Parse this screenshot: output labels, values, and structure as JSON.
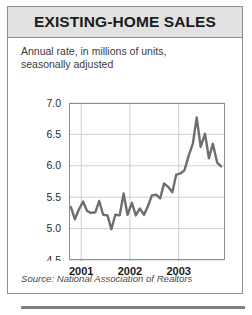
{
  "figure": {
    "title": "EXISTING-HOME SALES",
    "subtitle_lines": [
      "Annual rate, in millions of units,",
      "seasonally adjusted"
    ],
    "source": "Source: National Association of Realtors",
    "colors": {
      "title_band": "#e2e2e2",
      "border": "#8e8e8e",
      "line": "#6e6e6e",
      "grid": "#cfcfcf",
      "text": "#1b1b1b",
      "bottom_rule": "#808080"
    }
  },
  "chart_data": {
    "type": "line",
    "title": "EXISTING-HOME SALES",
    "subtitle": "Annual rate, in millions of units, seasonally adjusted",
    "source": "Source: National Association of Realtors",
    "xlabel": "",
    "ylabel": "",
    "ylim": [
      4.5,
      7.0
    ],
    "yticks": [
      7.0,
      6.5,
      6.0,
      5.5,
      5.0,
      4.5
    ],
    "ytick_labels": [
      "7.0",
      "6.5",
      "6.0",
      "5.5",
      "5.0",
      "4.5"
    ],
    "xticks": [
      2001,
      2002,
      2003
    ],
    "xtick_labels": [
      "2001",
      "2002",
      "2003"
    ],
    "xlim": [
      2000.75,
      2003.95
    ],
    "grid": true,
    "grid_axis": "both",
    "legend": false,
    "series": [
      {
        "name": "Existing-home sales",
        "units": "millions of units, annual rate",
        "x": [
          2000.79,
          2000.87,
          2000.95,
          2001.04,
          2001.12,
          2001.2,
          2001.29,
          2001.37,
          2001.45,
          2001.54,
          2001.62,
          2001.7,
          2001.79,
          2001.87,
          2001.95,
          2002.04,
          2002.12,
          2002.2,
          2002.29,
          2002.37,
          2002.45,
          2002.54,
          2002.62,
          2002.7,
          2002.79,
          2002.87,
          2002.95,
          2003.04,
          2003.12,
          2003.2,
          2003.29,
          2003.37,
          2003.45,
          2003.54,
          2003.62,
          2003.7,
          2003.79,
          2003.87
        ],
        "values": [
          5.34,
          5.15,
          5.3,
          5.43,
          5.28,
          5.25,
          5.26,
          5.44,
          5.22,
          5.21,
          4.99,
          5.22,
          5.21,
          5.56,
          5.22,
          5.41,
          5.21,
          5.32,
          5.22,
          5.36,
          5.53,
          5.54,
          5.48,
          5.72,
          5.66,
          5.58,
          5.86,
          5.88,
          5.93,
          6.15,
          6.35,
          6.77,
          6.3,
          6.51,
          6.12,
          6.35,
          6.05,
          5.99
        ]
      }
    ],
    "annotations": []
  }
}
